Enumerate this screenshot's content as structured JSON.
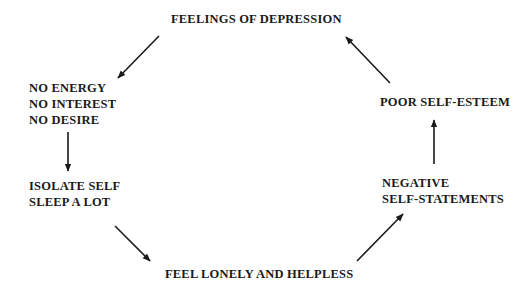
{
  "diagram": {
    "type": "cycle",
    "nodes": [
      {
        "id": "feelings-of-depression",
        "lines": [
          "FEELINGS OF DEPRESSION"
        ]
      },
      {
        "id": "no-energy",
        "lines": [
          "NO ENERGY",
          "NO INTEREST",
          "NO DESIRE"
        ]
      },
      {
        "id": "isolate-self",
        "lines": [
          "ISOLATE SELF",
          "SLEEP A LOT"
        ]
      },
      {
        "id": "feel-lonely",
        "lines": [
          "FEEL LONELY AND HELPLESS"
        ]
      },
      {
        "id": "negative-self-statements",
        "lines": [
          "NEGATIVE",
          "SELF-STATEMENTS"
        ]
      },
      {
        "id": "poor-self-esteem",
        "lines": [
          "POOR SELF-ESTEEM"
        ]
      }
    ],
    "edges": [
      {
        "from": "feelings-of-depression",
        "to": "no-energy"
      },
      {
        "from": "no-energy",
        "to": "isolate-self"
      },
      {
        "from": "isolate-self",
        "to": "feel-lonely"
      },
      {
        "from": "feel-lonely",
        "to": "negative-self-statements"
      },
      {
        "from": "negative-self-statements",
        "to": "poor-self-esteem"
      },
      {
        "from": "poor-self-esteem",
        "to": "feelings-of-depression"
      }
    ],
    "line_color": "#1a1a1a"
  }
}
